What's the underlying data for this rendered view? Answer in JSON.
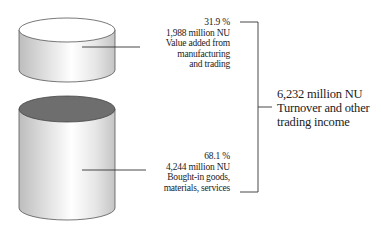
{
  "diagram": {
    "segments": [
      {
        "id": "value-added",
        "percent": "31.9 %",
        "amount": "1,988 million NU",
        "label_lines": [
          "Value added from",
          "manufacturing",
          "and trading"
        ],
        "top_color": "#ffffff"
      },
      {
        "id": "bought-in",
        "percent": "68.1 %",
        "amount": "4,244 million NU",
        "label_lines": [
          "Bought-in goods,",
          "materials, services"
        ],
        "top_color": "#6e6e6e"
      }
    ],
    "total": {
      "amount": "6,232 million NU",
      "label_lines": [
        "Turnover and other",
        "trading income"
      ]
    },
    "colors": {
      "line": "#333333",
      "cylinder_edge": "#555555",
      "cylinder_shade": "#c8c8c8",
      "cylinder_highlight": "#ffffff"
    }
  }
}
